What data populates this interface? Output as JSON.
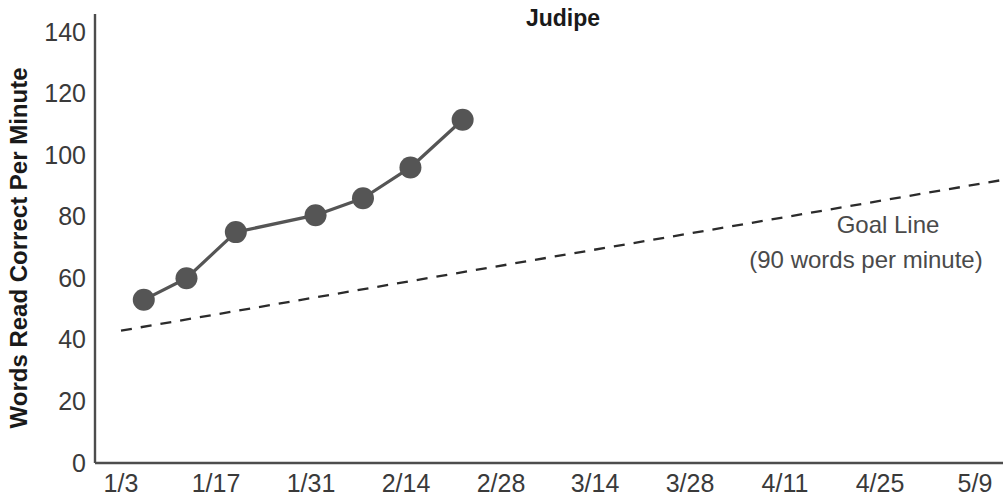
{
  "chart_data": {
    "type": "line",
    "title": "Judipe",
    "xlabel": "",
    "ylabel": "Words Read Correct Per Minute",
    "ylim": [
      0,
      140
    ],
    "ytick_step": 20,
    "yticks": [
      "0",
      "20",
      "40",
      "60",
      "80",
      "100",
      "120",
      "140"
    ],
    "xticks": [
      "1/3",
      "1/17",
      "1/31",
      "2/14",
      "2/28",
      "3/14",
      "3/28",
      "4/11",
      "4/25",
      "5/9"
    ],
    "grid": false,
    "legend": "none",
    "series": [
      {
        "name": "Words Read Correct Per Minute",
        "marker": "circle",
        "color": "#555555",
        "x": [
          "1/6",
          "1/13",
          "1/20",
          "2/3",
          "2/10",
          "2/21",
          "2/28"
        ],
        "x_frac": [
          0.24,
          0.69,
          1.21,
          2.05,
          2.55,
          3.05,
          3.6
        ],
        "values": [
          53,
          60,
          75,
          80.5,
          86,
          96,
          111.5
        ]
      }
    ],
    "reference_line": {
      "name": "Goal Line",
      "style": "dashed",
      "color": "#2b2b2b",
      "x_frac_start": 0.0,
      "x_frac_end": 9.3,
      "value_start": 43,
      "value_end": 92
    },
    "annotations": [
      {
        "name": "goal-line-label",
        "line1": "Goal Line",
        "line2": "(90 words per minute)"
      }
    ]
  }
}
